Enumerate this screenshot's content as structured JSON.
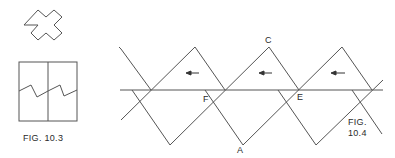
{
  "figures": [
    {
      "id": "fig-10-3",
      "caption": "FIG. 10.3"
    },
    {
      "id": "fig-10-4",
      "caption_line1": "FIG.",
      "caption_line2": "10.4"
    }
  ],
  "points": {
    "A": "A",
    "C": "C",
    "E": "E",
    "F": "F"
  },
  "colors": {
    "line": "#555555",
    "text": "#2a2a2a",
    "background": "#ffffff"
  },
  "arrows": [
    {
      "direction": "left"
    },
    {
      "direction": "left"
    },
    {
      "direction": "left"
    }
  ]
}
